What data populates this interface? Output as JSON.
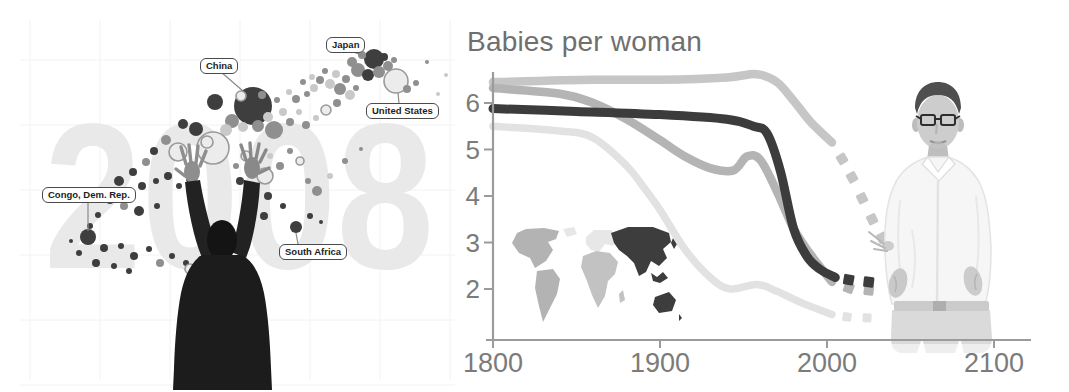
{
  "left_panel": {
    "year_watermark": "2008",
    "palette": {
      "dark": "#3e3e3e",
      "mid": "#8f8f8f",
      "light": "#c9c9c9",
      "ring_fill": "#ececec",
      "ring_stroke": "#9a9a9a"
    },
    "country_labels": [
      {
        "text": "Japan",
        "box_x": 326,
        "box_y": 37,
        "line": [
          351,
          51,
          366,
          57
        ]
      },
      {
        "text": "China",
        "box_x": 200,
        "box_y": 58,
        "line": [
          221,
          72,
          243,
          91
        ]
      },
      {
        "text": "United States",
        "box_x": 366,
        "box_y": 103,
        "line": [
          399,
          103,
          398,
          93
        ]
      },
      {
        "text": "Congo, Dem. Rep.",
        "box_x": 42,
        "box_y": 187,
        "line": [
          88,
          201,
          88,
          231
        ]
      },
      {
        "text": "South Africa",
        "box_x": 279,
        "box_y": 244,
        "line": [
          298,
          244,
          296,
          233
        ]
      }
    ],
    "bubbles": [
      [
        374,
        59,
        10,
        "dark"
      ],
      [
        362,
        55,
        4,
        "mid"
      ],
      [
        352,
        62,
        5,
        "mid"
      ],
      [
        358,
        70,
        7,
        "mid"
      ],
      [
        368,
        75,
        6,
        "dark"
      ],
      [
        379,
        72,
        6,
        "mid"
      ],
      [
        388,
        66,
        5,
        "mid"
      ],
      [
        384,
        57,
        4,
        "dark"
      ],
      [
        394,
        60,
        3,
        "mid"
      ],
      [
        396,
        81,
        12,
        "ring"
      ],
      [
        407,
        89,
        4,
        "mid"
      ],
      [
        416,
        83,
        3,
        "mid"
      ],
      [
        427,
        62,
        2,
        "mid"
      ],
      [
        438,
        94,
        2,
        "light"
      ],
      [
        446,
        75,
        2,
        "light"
      ],
      [
        303,
        82,
        3,
        "mid"
      ],
      [
        312,
        77,
        3,
        "light"
      ],
      [
        320,
        80,
        4,
        "mid"
      ],
      [
        330,
        84,
        5,
        "light"
      ],
      [
        340,
        89,
        6,
        "mid"
      ],
      [
        346,
        79,
        4,
        "mid"
      ],
      [
        336,
        74,
        4,
        "light"
      ],
      [
        325,
        71,
        3,
        "mid"
      ],
      [
        314,
        88,
        4,
        "light"
      ],
      [
        307,
        94,
        3,
        "mid"
      ],
      [
        296,
        99,
        4,
        "mid"
      ],
      [
        289,
        92,
        3,
        "light"
      ],
      [
        350,
        95,
        5,
        "light"
      ],
      [
        356,
        88,
        3,
        "mid"
      ],
      [
        253,
        106,
        19,
        "dark"
      ],
      [
        215,
        102,
        8,
        "dark"
      ],
      [
        232,
        121,
        7,
        "mid"
      ],
      [
        243,
        127,
        5,
        "light"
      ],
      [
        226,
        130,
        6,
        "light"
      ],
      [
        258,
        126,
        6,
        "mid"
      ],
      [
        268,
        117,
        5,
        "light"
      ],
      [
        241,
        96,
        5,
        "ring"
      ],
      [
        262,
        95,
        4,
        "mid"
      ],
      [
        274,
        130,
        9,
        "mid"
      ],
      [
        283,
        112,
        4,
        "light"
      ],
      [
        277,
        100,
        3,
        "mid"
      ],
      [
        290,
        122,
        4,
        "mid"
      ],
      [
        299,
        112,
        3,
        "light"
      ],
      [
        306,
        125,
        4,
        "mid"
      ],
      [
        316,
        118,
        3,
        "light"
      ],
      [
        326,
        110,
        5,
        "ring"
      ],
      [
        337,
        103,
        4,
        "mid"
      ],
      [
        213,
        148,
        16,
        "ring"
      ],
      [
        207,
        142,
        6,
        "ring"
      ],
      [
        178,
        152,
        9,
        "ring"
      ],
      [
        166,
        140,
        5,
        "mid"
      ],
      [
        196,
        129,
        7,
        "dark"
      ],
      [
        183,
        124,
        5,
        "dark"
      ],
      [
        154,
        151,
        4,
        "dark"
      ],
      [
        146,
        162,
        4,
        "mid"
      ],
      [
        133,
        172,
        4,
        "dark"
      ],
      [
        119,
        181,
        5,
        "dark"
      ],
      [
        142,
        186,
        4,
        "dark"
      ],
      [
        156,
        181,
        3,
        "dark"
      ],
      [
        168,
        176,
        4,
        "dark"
      ],
      [
        179,
        186,
        3,
        "dark"
      ],
      [
        190,
        179,
        4,
        "dark"
      ],
      [
        110,
        200,
        4,
        "dark"
      ],
      [
        124,
        206,
        4,
        "mid"
      ],
      [
        139,
        211,
        5,
        "dark"
      ],
      [
        157,
        206,
        3,
        "dark"
      ],
      [
        98,
        215,
        3,
        "dark"
      ],
      [
        90,
        226,
        3,
        "dark"
      ],
      [
        71,
        241,
        2,
        "dark"
      ],
      [
        88,
        237,
        8,
        "dark"
      ],
      [
        104,
        248,
        4,
        "dark"
      ],
      [
        121,
        246,
        3,
        "dark"
      ],
      [
        134,
        256,
        4,
        "dark"
      ],
      [
        149,
        249,
        3,
        "dark"
      ],
      [
        79,
        253,
        3,
        "dark"
      ],
      [
        96,
        263,
        4,
        "dark"
      ],
      [
        114,
        266,
        3,
        "dark"
      ],
      [
        129,
        271,
        3,
        "dark"
      ],
      [
        160,
        263,
        4,
        "mid"
      ],
      [
        172,
        256,
        3,
        "dark"
      ],
      [
        186,
        263,
        3,
        "dark"
      ],
      [
        190,
        269,
        5,
        "ring"
      ],
      [
        201,
        259,
        3,
        "dark"
      ],
      [
        211,
        251,
        4,
        "dark"
      ],
      [
        221,
        266,
        3,
        "dark"
      ],
      [
        240,
        181,
        4,
        "dark"
      ],
      [
        254,
        190,
        3,
        "dark"
      ],
      [
        268,
        196,
        4,
        "dark"
      ],
      [
        283,
        206,
        3,
        "dark"
      ],
      [
        264,
        216,
        4,
        "dark"
      ],
      [
        249,
        206,
        3,
        "dark"
      ],
      [
        296,
        227,
        6,
        "dark"
      ],
      [
        310,
        216,
        3,
        "dark"
      ],
      [
        321,
        222,
        2,
        "dark"
      ],
      [
        317,
        191,
        5,
        "mid"
      ],
      [
        308,
        181,
        3,
        "mid"
      ],
      [
        330,
        176,
        3,
        "light"
      ],
      [
        345,
        161,
        3,
        "mid"
      ],
      [
        300,
        161,
        4,
        "ring"
      ],
      [
        290,
        151,
        3,
        "mid"
      ],
      [
        280,
        166,
        4,
        "mid"
      ],
      [
        270,
        156,
        3,
        "light"
      ],
      [
        265,
        176,
        8,
        "ring"
      ],
      [
        255,
        166,
        4,
        "mid"
      ],
      [
        246,
        156,
        5,
        "ring"
      ],
      [
        236,
        166,
        3,
        "mid"
      ],
      [
        302,
        251,
        3,
        "dark"
      ],
      [
        316,
        246,
        2,
        "dark"
      ],
      [
        331,
        256,
        2,
        "mid"
      ],
      [
        361,
        149,
        2,
        "mid"
      ]
    ]
  },
  "chart_data": {
    "type": "line",
    "title": "Babies per woman",
    "xlabel": "",
    "ylabel": "Babies per woman",
    "x_range": [
      1800,
      2100
    ],
    "ylim": [
      1,
      7
    ],
    "x_ticks": [
      1800,
      1900,
      2000,
      2100
    ],
    "y_ticks": [
      6,
      5,
      4,
      3,
      2
    ],
    "grid": false,
    "legend_position": "none",
    "projection_style": "square dashes after ~2005, hidden behind presenter toward 2100",
    "series": [
      {
        "name": "Africa",
        "color": "#c6c6c6",
        "z": 1,
        "solid": [
          [
            1800,
            6.45
          ],
          [
            1860,
            6.5
          ],
          [
            1900,
            6.5
          ],
          [
            1940,
            6.55
          ],
          [
            1958,
            6.62
          ],
          [
            1970,
            6.45
          ],
          [
            1980,
            6.05
          ],
          [
            1990,
            5.6
          ],
          [
            2003,
            5.15
          ]
        ],
        "projection_dashes": [
          [
            2009,
            4.8
          ],
          [
            2015,
            4.4
          ],
          [
            2021,
            3.95
          ],
          [
            2027,
            3.5
          ],
          [
            2033,
            3.1
          ]
        ]
      },
      {
        "name": "Asia",
        "color": "#3c3c3c",
        "z": 3,
        "solid": [
          [
            1800,
            5.88
          ],
          [
            1850,
            5.82
          ],
          [
            1900,
            5.75
          ],
          [
            1940,
            5.65
          ],
          [
            1956,
            5.5
          ],
          [
            1964,
            5.35
          ],
          [
            1972,
            4.55
          ],
          [
            1980,
            3.3
          ],
          [
            1988,
            2.7
          ],
          [
            1996,
            2.42
          ],
          [
            2005,
            2.25
          ]
        ],
        "projection_dashes": [
          [
            2013,
            2.2
          ],
          [
            2025,
            2.15
          ]
        ]
      },
      {
        "name": "Americas",
        "color": "#b4b4b4",
        "z": 2,
        "solid": [
          [
            1800,
            6.32
          ],
          [
            1840,
            6.2
          ],
          [
            1860,
            6.0
          ],
          [
            1880,
            5.65
          ],
          [
            1900,
            5.2
          ],
          [
            1915,
            4.85
          ],
          [
            1930,
            4.6
          ],
          [
            1944,
            4.55
          ],
          [
            1952,
            4.85
          ],
          [
            1960,
            4.78
          ],
          [
            1970,
            4.1
          ],
          [
            1980,
            3.3
          ],
          [
            1990,
            2.75
          ],
          [
            2003,
            2.15
          ]
        ],
        "projection_dashes": [
          [
            2013,
            2.02
          ],
          [
            2025,
            1.97
          ]
        ]
      },
      {
        "name": "Europe",
        "color": "#e2e2e2",
        "z": 0,
        "solid": [
          [
            1800,
            5.5
          ],
          [
            1840,
            5.4
          ],
          [
            1860,
            5.25
          ],
          [
            1880,
            4.65
          ],
          [
            1890,
            4.2
          ],
          [
            1900,
            3.7
          ],
          [
            1915,
            2.85
          ],
          [
            1930,
            2.25
          ],
          [
            1942,
            2.0
          ],
          [
            1958,
            2.1
          ],
          [
            1970,
            1.95
          ],
          [
            1985,
            1.7
          ],
          [
            2003,
            1.45
          ]
        ],
        "projection_dashes": [
          [
            2012,
            1.4
          ],
          [
            2024,
            1.38
          ]
        ]
      }
    ]
  },
  "map_inset": {
    "regions": [
      {
        "name": "Americas",
        "color": "#b3b3b3"
      },
      {
        "name": "Europe",
        "color": "#e7e7e7"
      },
      {
        "name": "Africa",
        "color": "#c2c2c2"
      },
      {
        "name": "Asia & Oceania",
        "color": "#3d3d3d"
      }
    ]
  }
}
